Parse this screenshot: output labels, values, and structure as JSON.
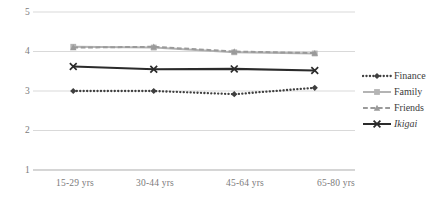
{
  "chart_data": {
    "type": "line",
    "title": "",
    "xlabel": "",
    "ylabel": "",
    "categories": [
      "15-29 yrs",
      "30-44 yrs",
      "45-64 yrs",
      "65-80 yrs"
    ],
    "yticks": [
      "5",
      "4",
      "3",
      "2",
      "1"
    ],
    "ylim": [
      1,
      5
    ],
    "grid": true,
    "legend_position": "right",
    "series": [
      {
        "name": "Finance",
        "values": [
          3.0,
          3.0,
          2.92,
          3.08
        ],
        "color": "#3f3f3f",
        "line_style": "dotted",
        "marker": "diamond",
        "italic": false
      },
      {
        "name": "Family",
        "values": [
          4.12,
          4.1,
          3.98,
          3.95
        ],
        "color": "#b4b4b4",
        "line_style": "solid",
        "marker": "square",
        "italic": false
      },
      {
        "name": "Friends",
        "values": [
          4.1,
          4.12,
          4.0,
          3.96
        ],
        "color": "#9a9a9a",
        "line_style": "dashed",
        "marker": "triangle",
        "italic": false
      },
      {
        "name": "Ikigai",
        "values": [
          3.62,
          3.55,
          3.56,
          3.52
        ],
        "color": "#2b2b2b",
        "line_style": "solid",
        "marker": "x",
        "italic": true
      }
    ]
  },
  "axes": {
    "gridline_color": "#d9d9d9",
    "axis_color": "#bfbfbf",
    "tick_text_color": "#7b7b7b"
  }
}
